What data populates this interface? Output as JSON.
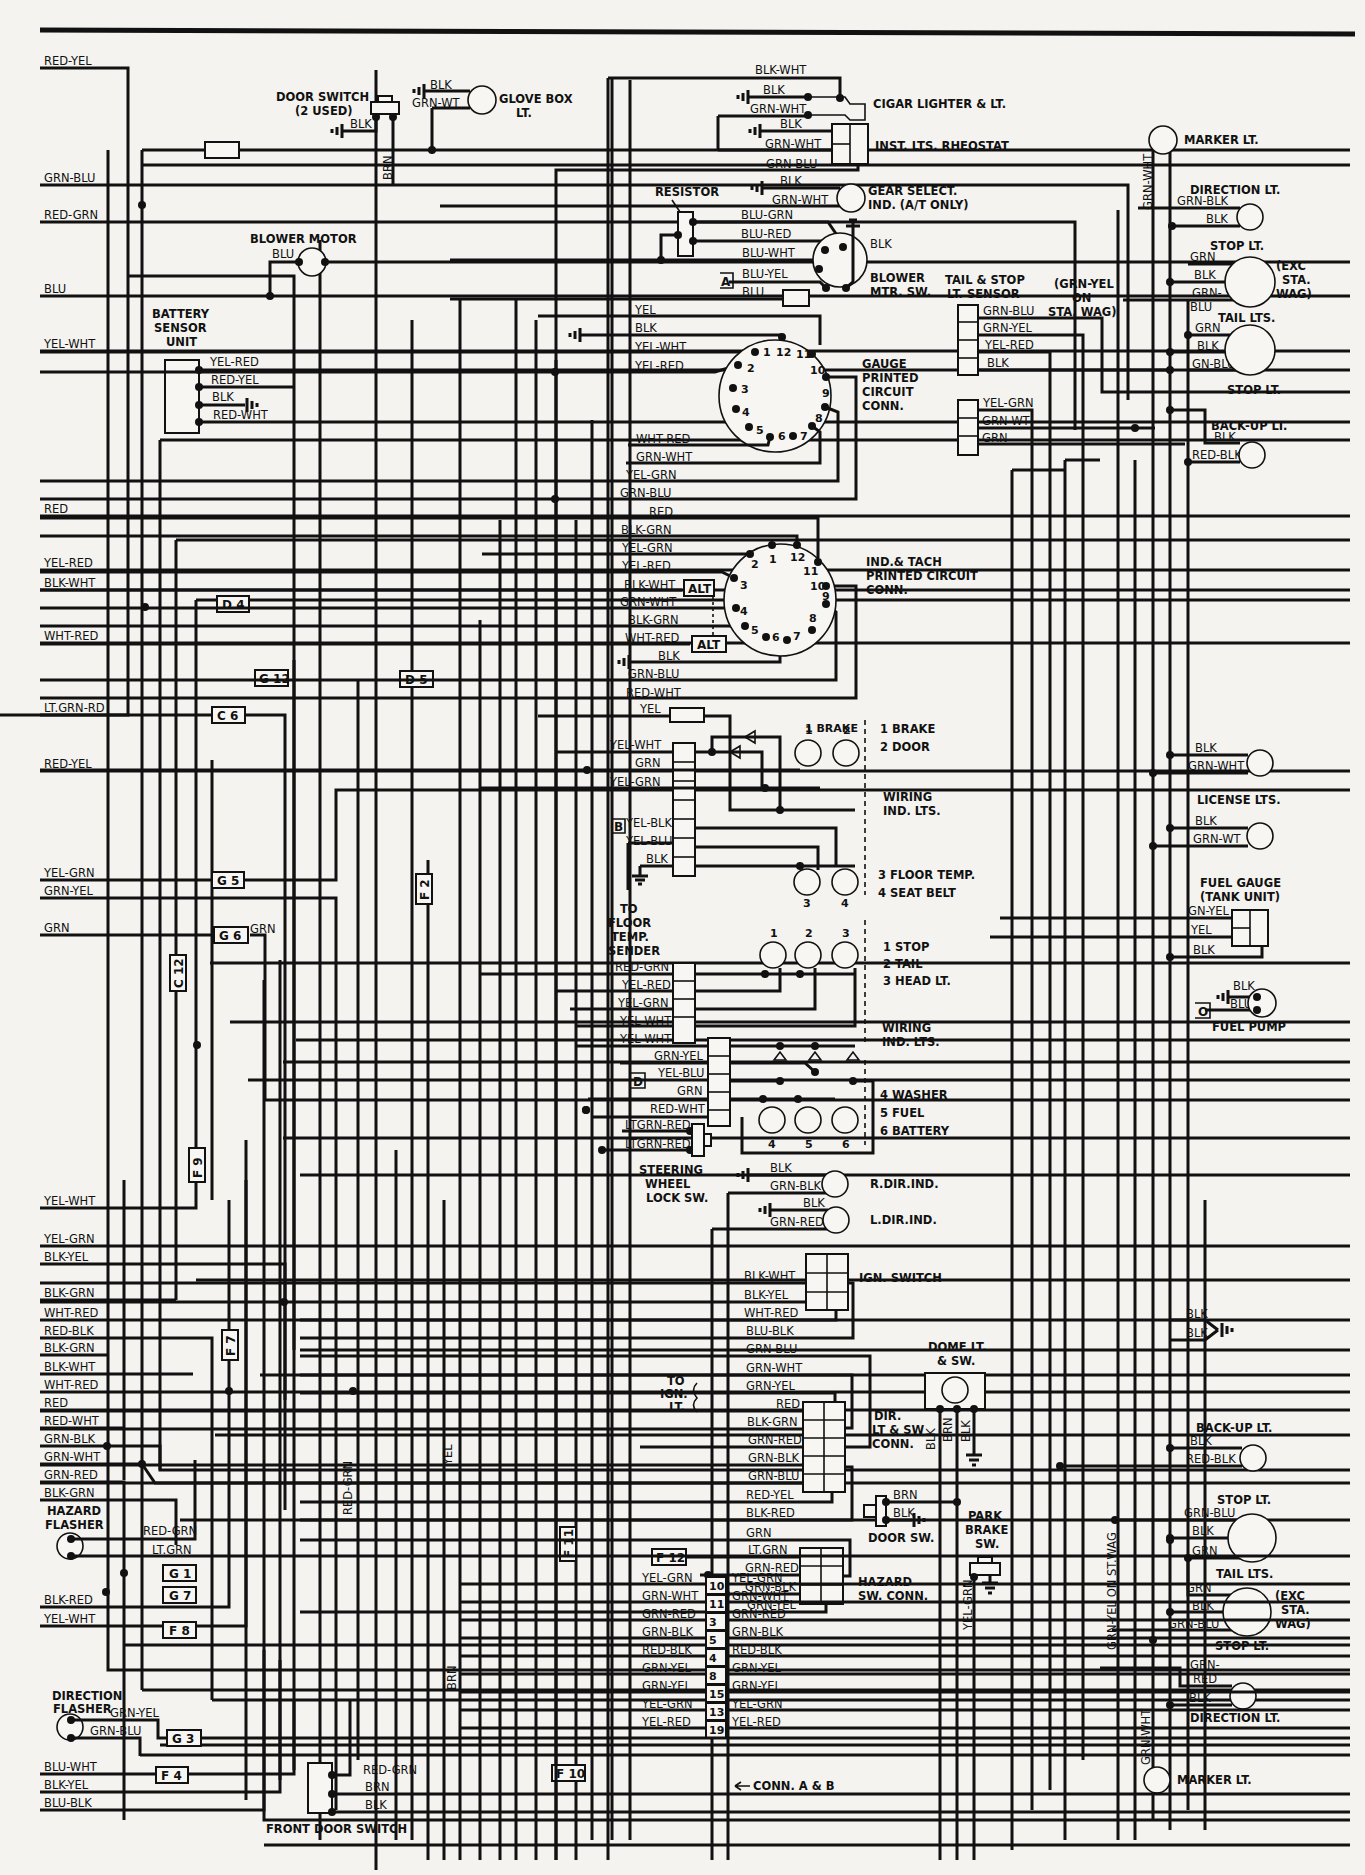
{
  "left_wires": [
    {
      "label": "RED-YEL",
      "y": 68
    },
    {
      "label": "GRN-BLU",
      "y": 185
    },
    {
      "label": "RED-GRN",
      "y": 222
    },
    {
      "label": "BLU",
      "y": 296
    },
    {
      "label": "YEL-WHT",
      "y": 351
    },
    {
      "label": "RED",
      "y": 516
    },
    {
      "label": "YEL-RED",
      "y": 570
    },
    {
      "label": "BLK-WHT",
      "y": 590
    },
    {
      "label": "WHT-RED",
      "y": 643
    },
    {
      "label": "LT.GRN-RD",
      "y": 715
    },
    {
      "label": "RED-YEL",
      "y": 771
    },
    {
      "label": "YEL-GRN",
      "y": 880
    },
    {
      "label": "GRN-YEL",
      "y": 898
    },
    {
      "label": "GRN",
      "y": 935
    },
    {
      "label": "YEL-WHT",
      "y": 1208
    },
    {
      "label": "YEL-GRN",
      "y": 1246
    },
    {
      "label": "BLK-YEL",
      "y": 1264
    },
    {
      "label": "BLK-GRN",
      "y": 1300
    },
    {
      "label": "WHT-RED",
      "y": 1320
    },
    {
      "label": "RED-BLK",
      "y": 1338
    },
    {
      "label": "BLK-GRN",
      "y": 1355
    },
    {
      "label": "BLK-WHT",
      "y": 1374
    },
    {
      "label": "WHT-RED",
      "y": 1392
    },
    {
      "label": "RED",
      "y": 1410
    },
    {
      "label": "RED-WHT",
      "y": 1428
    },
    {
      "label": "GRN-BLK",
      "y": 1446
    },
    {
      "label": "GRN-WHT",
      "y": 1464
    },
    {
      "label": "GRN-RED",
      "y": 1482
    },
    {
      "label": "BLK-GRN",
      "y": 1500
    },
    {
      "label": "BLK-RED",
      "y": 1607
    },
    {
      "label": "YEL-WHT",
      "y": 1626
    },
    {
      "label": "BLU-WHT",
      "y": 1774
    },
    {
      "label": "BLK-YEL",
      "y": 1792
    },
    {
      "label": "BLU-BLK",
      "y": 1810
    }
  ],
  "components": {
    "door_switch": {
      "title": "DOOR SWITCH",
      "subtitle": "(2 USED)",
      "wire1": "BLK",
      "wire2": "BRN"
    },
    "glove_box": {
      "title": "GLOVE BOX",
      "subtitle": "LT.",
      "wire1": "BLK",
      "wire2": "GRN-WT"
    },
    "blower_motor": {
      "title": "BLOWER MOTOR",
      "wire": "BLU"
    },
    "battery_sensor": {
      "title1": "BATTERY",
      "title2": "SENSOR",
      "title3": "UNIT",
      "wires": [
        "YEL-RED",
        "RED-YEL",
        "BLK",
        "RED-WHT"
      ]
    },
    "cigar_lighter": {
      "title": "CIGAR LIGHTER & LT.",
      "wires": [
        "BLK-WHT",
        "BLK",
        "GRN-WHT"
      ]
    },
    "rheostat": {
      "title": "INST. LTS. RHEOSTAT",
      "wires": [
        "BLK",
        "GRN-WHT",
        "GRN-BLU"
      ]
    },
    "resistor": {
      "title": "RESISTOR"
    },
    "gear_select": {
      "title1": "GEAR SELECT.",
      "title2": "IND. (A/T ONLY)",
      "wires": [
        "BLK",
        "GRN-WHT"
      ]
    },
    "blower_switch": {
      "title1": "BLOWER",
      "title2": "MTR. SW.",
      "wires": [
        "BLU-GRN",
        "BLU-RED",
        "BLU-WHT",
        "BLU-YEL",
        "BLU"
      ],
      "gnd": "BLK",
      "tag": "A"
    },
    "gauge_conn": {
      "title1": "GAUGE",
      "title2": "PRINTED",
      "title3": "CIRCUIT",
      "title4": "CONN.",
      "wires": [
        "YEL",
        "BLK",
        "YEL-WHT",
        "YEL-RED",
        "BLK",
        "WHT-RED",
        "GRN-WHT",
        "YEL-GRN",
        "GRN-BLU"
      ],
      "pins": [
        "1",
        "2",
        "3",
        "4",
        "5",
        "6",
        "7",
        "8",
        "9",
        "10",
        "11",
        "12"
      ]
    },
    "tach_conn": {
      "title1": "IND.& TACH",
      "title2": "PRINTED CIRCUIT",
      "title3": "CONN.",
      "wires": [
        "RED",
        "BLK-GRN",
        "YEL-GRN",
        "YEL-RED",
        "BLK-WHT",
        "GRN-WHT",
        "BLK-GRN",
        "WHT-RED",
        "BLK",
        "GRN-BLU",
        "RED-WHT"
      ],
      "alt": "ALT",
      "pins": [
        "1",
        "2",
        "3",
        "4",
        "5",
        "6",
        "7",
        "8",
        "9",
        "10",
        "11",
        "12"
      ]
    },
    "tail_stop_sensor": {
      "title1": "TAIL & STOP",
      "title2": "LT. SENSOR",
      "note1": "(GRN-YEL",
      "note2": "ON",
      "note3": "STA. WAG)",
      "wires": [
        "GRN-BLU",
        "GRN-YEL",
        "YEL-RED",
        "BLK",
        "YEL-GRN",
        "GRN-WT",
        "GRN"
      ]
    },
    "ind_lts_1": {
      "wires": [
        "YEL",
        "YEL-WHT",
        "GRN",
        "YEL-GRN",
        "YEL-BLK",
        "YEL-BLU",
        "BLK"
      ],
      "tag": "B",
      "legend": [
        "1 BRAKE",
        "2 DOOR",
        "3 FLOOR TEMP.",
        "4 SEAT BELT"
      ],
      "group": "WIRING",
      "group2": "IND. LTS.",
      "to": [
        "TO",
        "FLOOR",
        "TEMP.",
        "SENDER"
      ]
    },
    "ind_lts_2": {
      "wires": [
        "RED-GRN",
        "YEL-RED",
        "YEL-GRN",
        "YEL-WHT",
        "YEL-WHT"
      ],
      "legend": [
        "1 STOP",
        "2 TAIL",
        "3 HEAD LT."
      ],
      "group": "WIRING",
      "group2": "IND. LTS."
    },
    "ind_lts_3": {
      "wires": [
        "GRN-YEL",
        "YEL-BLU",
        "GRN",
        "RED-WHT"
      ],
      "tag": "D",
      "legend": [
        "4 WASHER",
        "5 FUEL",
        "6 BATTERY"
      ]
    },
    "steering_lock": {
      "title1": "STEERING",
      "title2": "WHEEL",
      "title3": "LOCK SW.",
      "wires": [
        "LTGRN-RED",
        "LTGRN-RED"
      ]
    },
    "r_dir_ind": {
      "title": "R.DIR.IND.",
      "wires": [
        "BLK",
        "GRN-BLK"
      ]
    },
    "l_dir_ind": {
      "title": "L.DIR.IND.",
      "wires": [
        "BLK",
        "GRN-RED"
      ]
    },
    "ign_switch": {
      "title": "IGN. SWITCH",
      "wires": [
        "BLK-WHT",
        "BLK-YEL",
        "WHT-RED",
        "BLU-BLK"
      ]
    },
    "dir_conn": {
      "title1": "DIR.",
      "title2": "LT & SW",
      "title3": "CONN.",
      "to": [
        "TO",
        "IGN.",
        "LT."
      ],
      "wires": [
        "GRN-BLU",
        "GRN-WHT",
        "GRN-YEL",
        "RED",
        "BLK-GRN",
        "GRN-RED",
        "GRN-BLK",
        "GRN-BLU",
        "RED-YEL",
        "BLK-RED"
      ]
    },
    "hazard_conn": {
      "title1": "HAZARD",
      "title2": "SW. CONN.",
      "wires": [
        "GRN",
        "LT.GRN",
        "GRN-RED",
        "GRN-BLK",
        "GRN-YEL"
      ]
    },
    "dome_lt": {
      "title1": "DOME LT.",
      "title2": "& SW.",
      "wires": [
        "BLK",
        "BRN",
        "BLK"
      ]
    },
    "door_sw": {
      "title": "DOOR SW.",
      "wires": [
        "BRN",
        "BLK"
      ]
    },
    "park_brake": {
      "title1": "PARK",
      "title2": "BRAKE",
      "title3": "SW.",
      "wire": "YEL-GRN"
    },
    "conn_ab": {
      "title": "CONN. A & B",
      "rows": [
        {
          "left": "YEL-GRN",
          "pin": "10",
          "right": "YEL-GRN"
        },
        {
          "left": "GRN-WHT",
          "pin": "11",
          "right": "GRN-WHT"
        },
        {
          "left": "GRN-RED",
          "pin": "3",
          "right": "GRN-RED"
        },
        {
          "left": "GRN-BLK",
          "pin": "5",
          "right": "GRN-BLK"
        },
        {
          "left": "RED-BLK",
          "pin": "4",
          "right": "RED-BLK"
        },
        {
          "left": "GRN-YEL",
          "pin": "8",
          "right": "GRN-YEL"
        },
        {
          "left": "GRN-YEL",
          "pin": "15",
          "right": "GRN-YEL"
        },
        {
          "left": "YEL-GRN",
          "pin": "13",
          "right": "YEL-GRN"
        },
        {
          "left": "YEL-RED",
          "pin": "19",
          "right": "YEL-RED"
        }
      ]
    },
    "hazard_flasher": {
      "title1": "HAZARD",
      "title2": "FLASHER",
      "wires": [
        "RED-GRN",
        "LT.GRN"
      ]
    },
    "direction_flasher": {
      "title1": "DIRECTION",
      "title2": "FLASHER",
      "wires": [
        "GRN-YEL",
        "GRN-BLU"
      ]
    },
    "front_door_switch": {
      "title": "FRONT DOOR SWITCH",
      "wires": [
        "RED-GRN",
        "BRN",
        "BLK"
      ]
    },
    "fuel_gauge": {
      "title1": "FUEL GAUGE",
      "title2": "(TANK UNIT)",
      "wires": [
        "GN-YEL",
        "YEL",
        "BLK"
      ]
    },
    "fuel_pump": {
      "title": "FUEL PUMP",
      "wires": [
        "BLK",
        "BLU"
      ],
      "tag": "O"
    },
    "license_lts": {
      "title": "LICENSE LTS.",
      "wires_a": [
        "BLK",
        "GRN-WHT"
      ],
      "wires_b": [
        "BLK",
        "GRN-WT"
      ]
    },
    "rear_upper": {
      "marker": "MARKER LT.",
      "marker_wire": "GRN-WHT",
      "direction": "DIRECTION LT.",
      "direction_wires": [
        "GRN-BLK",
        "BLK"
      ],
      "stop": "STOP LT.",
      "stop_wires": [
        "GRN",
        "BLK",
        "GRN-",
        "BLU"
      ],
      "exc": [
        "(EXC",
        "STA.",
        "WAG)"
      ],
      "tail": "TAIL LTS.",
      "tail_wires": [
        "GRN",
        "BLK",
        "GN-BLU"
      ],
      "stop2": "STOP LT.",
      "backup": "BACK-UP LT.",
      "backup_wires": [
        "BLK",
        "RED-BLK"
      ]
    },
    "rear_lower": {
      "ground_wires": [
        "BLK",
        "BLK"
      ],
      "backup": "BACK-UP LT.",
      "backup_wires": [
        "BLK",
        "RED-BLK"
      ],
      "stop": "STOP LT.",
      "stop_wires": [
        "GRN-BLU",
        "BLK",
        "GRN"
      ],
      "tail": "TAIL LTS.",
      "tail_wires": [
        "GRN",
        "BLK",
        "GRN-BLU"
      ],
      "exc": [
        "(EXC",
        "STA.",
        "WAG)"
      ],
      "stop2": "STOP LT.",
      "direction": "DIRECTION LT.",
      "direction_wires": [
        "GRN-",
        "RED",
        "BLK"
      ],
      "marker": "MARKER LT.",
      "marker_wire": "GRN-WHT",
      "stwag_note": "GRN-YEL ON ST.WAG"
    }
  },
  "fuses": [
    "D 4",
    "G 12",
    "D 5",
    "C 6",
    "G 5",
    "G 6",
    "C 12",
    "F 9",
    "F 2",
    "F 7",
    "F 11",
    "F 12",
    "G 1",
    "G 7",
    "F 8",
    "G 3",
    "F 4",
    "F 10"
  ],
  "vertical_labels": [
    "BRN",
    "YEL",
    "RED-GRN",
    "BRN",
    "BLK",
    "BRN",
    "BLK",
    "YEL-GRN",
    "GRN-WHT",
    "GRN-WHT"
  ],
  "extra_labels": {
    "g6_grn": "GRN"
  }
}
